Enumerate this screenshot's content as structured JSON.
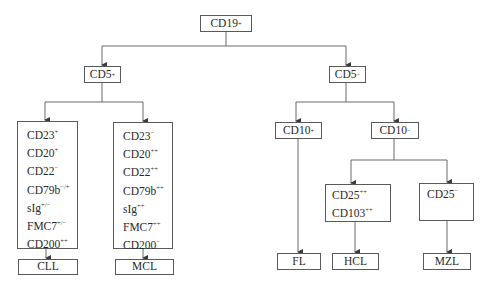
{
  "diagram": {
    "type": "flowchart",
    "root": {
      "base": "CD19",
      "sup": "+"
    },
    "branches": {
      "cd5_pos": {
        "base": "CD5",
        "sup": "+"
      },
      "cd5_neg": {
        "base": "CD5",
        "sup": "−"
      },
      "cd10_pos": {
        "base": "CD10",
        "sup": "+"
      },
      "cd10_neg": {
        "base": "CD10",
        "sup": "−"
      }
    },
    "panels": {
      "cll": [
        {
          "base": "CD23",
          "sup": "+"
        },
        {
          "base": "CD20",
          "sup": "+"
        },
        {
          "base": "CD22",
          "sup": "−"
        },
        {
          "base": "CD79b",
          "sup": "−/+"
        },
        {
          "base": "sIg",
          "sup": "+/−"
        },
        {
          "base": "FMC7",
          "sup": "+/−"
        },
        {
          "base": "CD200",
          "sup": "++"
        }
      ],
      "mcl": [
        {
          "base": "CD23",
          "sup": "−"
        },
        {
          "base": "CD20",
          "sup": "++"
        },
        {
          "base": "CD22",
          "sup": "++"
        },
        {
          "base": "CD79b",
          "sup": "++"
        },
        {
          "base": "sIg",
          "sup": "++"
        },
        {
          "base": "FMC7",
          "sup": "++"
        },
        {
          "base": "CD200",
          "sup": "−"
        }
      ],
      "hcl": [
        {
          "base": "CD25",
          "sup": "++"
        },
        {
          "base": "CD103",
          "sup": "++"
        }
      ],
      "mzl": [
        {
          "base": "CD25",
          "sup": "−"
        }
      ]
    },
    "outcomes": {
      "cll": "CLL",
      "mcl": "MCL",
      "fl": "FL",
      "hcl": "HCL",
      "mzl": "MZL"
    },
    "colors": {
      "line": "#5a5a5a",
      "text": "#2a2a2a",
      "background": "#ffffff"
    }
  }
}
